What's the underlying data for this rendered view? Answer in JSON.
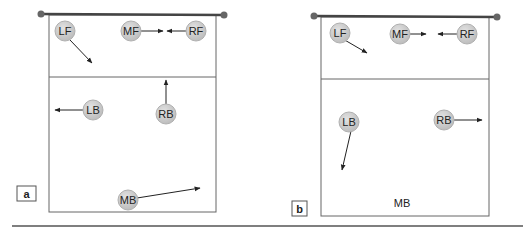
{
  "colors": {
    "court_line": "#555555",
    "net": "#444444",
    "player_fill": "#cccccc",
    "player_stroke": "#aaaaaa",
    "arrow": "#222222",
    "divider": "#555555"
  },
  "panels": [
    {
      "label": "a",
      "players": [
        {
          "id": "LF",
          "label": "LF"
        },
        {
          "id": "MF",
          "label": "MF"
        },
        {
          "id": "RF",
          "label": "RF"
        },
        {
          "id": "LB",
          "label": "LB"
        },
        {
          "id": "RB",
          "label": "RB"
        },
        {
          "id": "MB",
          "label": "MB"
        }
      ]
    },
    {
      "label": "b",
      "players": [
        {
          "id": "LF",
          "label": "LF"
        },
        {
          "id": "MF",
          "label": "MF"
        },
        {
          "id": "RF",
          "label": "RF"
        },
        {
          "id": "LB",
          "label": "LB"
        },
        {
          "id": "RB",
          "label": "RB"
        },
        {
          "id": "MB",
          "label": "MB"
        }
      ]
    }
  ]
}
